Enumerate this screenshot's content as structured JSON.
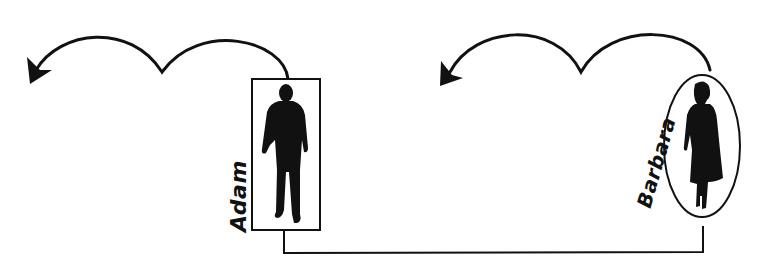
{
  "diagram": {
    "type": "relationship-diagram",
    "nodes": [
      {
        "id": "adam",
        "label": "Adam",
        "shape": "rectangle",
        "figure": "male-silhouette"
      },
      {
        "id": "barbara",
        "label": "Barbara",
        "shape": "ellipse",
        "figure": "female-silhouette"
      }
    ],
    "edges": [
      {
        "from": "adam",
        "to": "barbara",
        "style": "bracket-connector",
        "position": "bottom"
      }
    ],
    "arrows": [
      {
        "origin": "adam",
        "direction": "left",
        "shape": "double-loop-curved-arrow"
      },
      {
        "origin": "barbara",
        "direction": "left",
        "shape": "double-loop-curved-arrow"
      }
    ],
    "colors": {
      "stroke": "#111111",
      "background": "#ffffff"
    }
  }
}
